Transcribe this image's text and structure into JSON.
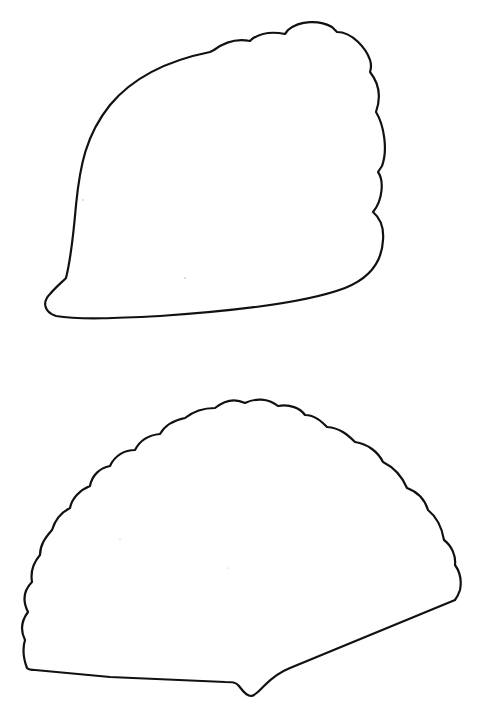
{
  "page": {
    "background": "#ffffff",
    "line_color": "#111111",
    "width": 482,
    "height": 710
  },
  "shapes": [
    {
      "name": "top-shell-outline",
      "description": "Rounded leaf/shell shape with scalloped upper-right edge"
    },
    {
      "name": "bottom-fan-outline",
      "description": "Fan-shaped scallop shell outline with scalloped arc edge and notched base"
    }
  ]
}
